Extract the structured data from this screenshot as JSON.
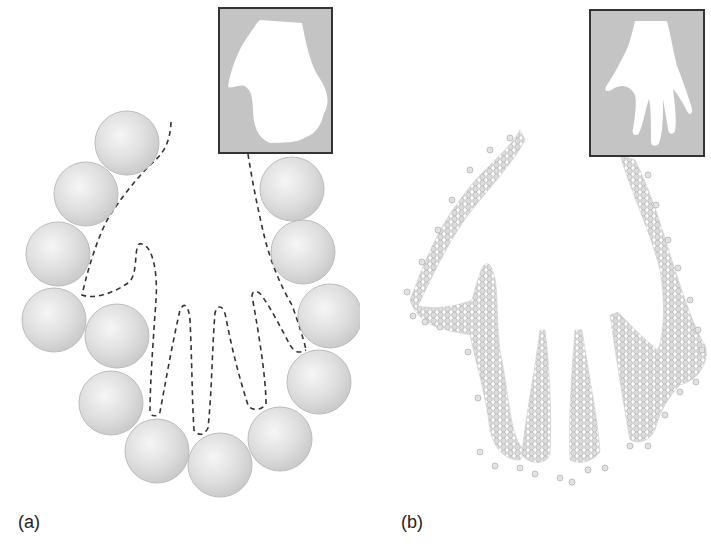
{
  "figure": {
    "panels": [
      {
        "id": "a",
        "label": "(a)",
        "description": "Large spheres surrounding a dashed hand outline (coarse packing)",
        "inset_description": "Coarse hand silhouette"
      },
      {
        "id": "b",
        "label": "(b)",
        "description": "Many small particles filling a hand shape (fine packing)",
        "inset_description": "Detailed hand silhouette with five fingers"
      }
    ],
    "colors": {
      "sphere": "#d9d9d9",
      "sphere_edge": "#b8b8b8",
      "inset_bg": "#c4c4c4",
      "inset_border": "#333333",
      "dash": "#333333",
      "particle": "#d4d4d4"
    }
  }
}
